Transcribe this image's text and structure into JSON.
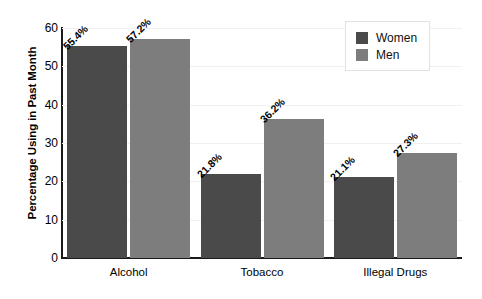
{
  "chart_data": {
    "type": "bar",
    "title": "",
    "xlabel": "",
    "ylabel": "Percentage Using in Past Month",
    "categories": [
      "Alcohol",
      "Tobacco",
      "Illegal Drugs"
    ],
    "series": [
      {
        "name": "Women",
        "color": "#4a4a4a",
        "values": [
          55.4,
          21.8,
          21.1
        ],
        "labels": [
          "55.4%",
          "21.8%",
          "21.1%"
        ]
      },
      {
        "name": "Men",
        "color": "#7d7d7d",
        "values": [
          57.2,
          36.2,
          27.3
        ],
        "labels": [
          "57.2%",
          "36.2%",
          "27.3%"
        ]
      }
    ],
    "ylim": [
      0,
      60
    ],
    "yticks": [
      0,
      10,
      20,
      30,
      40,
      50,
      60
    ],
    "ytick_labels": [
      "0",
      "10",
      "20",
      "30",
      "40",
      "50",
      "60"
    ],
    "grid": true,
    "legend_position": "top-right"
  },
  "legend": {
    "entries": [
      {
        "label": "Women",
        "color": "#4a4a4a"
      },
      {
        "label": "Men",
        "color": "#7d7d7d"
      }
    ]
  }
}
